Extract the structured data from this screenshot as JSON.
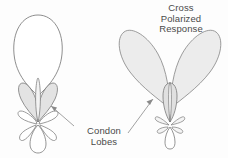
{
  "figure": {
    "kind": "antenna-radiation-pattern-diagram",
    "background_color": "#fdfdfd",
    "outline_color": "#6e6e6e",
    "fill_light": "#ececec",
    "fill_mid": "#dcdcdc",
    "text_color": "#4a4a4a"
  },
  "title": {
    "line1": "Cross",
    "line2": "Polarized",
    "line3": "Response"
  },
  "callout": {
    "line1": "Condon",
    "line2": "Lobes"
  },
  "patterns": {
    "left": {
      "name": "co-polarized-pattern",
      "main_lobe_fill": "#ffffff",
      "condon_lobe_fill": "#e3e3e3",
      "minor_lobe_fill": "#ffffff"
    },
    "right": {
      "name": "cross-polarized-pattern",
      "main_lobe_fill": "#ececec",
      "center_lobe_fill": "#e6e6e6",
      "minor_lobe_fill": "#f4f4f4"
    }
  }
}
